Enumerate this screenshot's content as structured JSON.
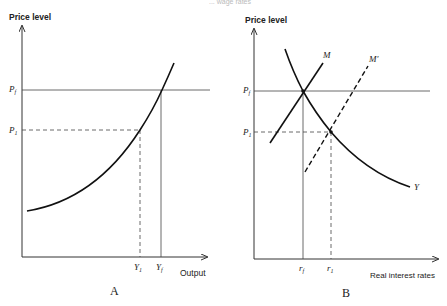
{
  "header_fragment": "... wage rates",
  "panel_a": {
    "label": "A",
    "y_axis_label": "Price level",
    "x_axis_label": "Output",
    "y_ticks": {
      "pf": "P",
      "pf_sub": "f",
      "p1": "P",
      "p1_sub": "1"
    },
    "x_ticks": {
      "y1": "Y",
      "y1_sub": "1",
      "yf": "Y",
      "yf_sub": "f"
    }
  },
  "panel_b": {
    "label": "B",
    "y_axis_label": "Price level",
    "x_axis_label": "Real interest rates",
    "y_ticks": {
      "pf": "P",
      "pf_sub": "f",
      "p1": "P",
      "p1_sub": "1"
    },
    "x_ticks": {
      "rf": "r",
      "rf_sub": "f",
      "r1": "r",
      "r1_sub": "1"
    },
    "curve_labels": {
      "m": "M",
      "m_prime": "M′",
      "y": "Y"
    }
  }
}
